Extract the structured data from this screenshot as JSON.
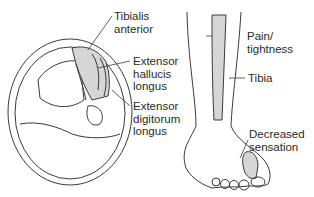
{
  "diagram": {
    "cross_section": {
      "labels": {
        "tibialis": [
          "Tibialis",
          "anterior"
        ],
        "ehl": [
          "Extensor",
          "hallucis",
          "longus"
        ],
        "edl": [
          "Extensor",
          "digitorum",
          "longus"
        ]
      }
    },
    "leg_view": {
      "labels": {
        "pain": [
          "Pain/",
          "tightness"
        ],
        "tibia": [
          "Tibia"
        ],
        "sensation": [
          "Decreased",
          "sensation"
        ]
      }
    },
    "colors": {
      "line": "#3a3a3a",
      "shade": "#d6d6d6",
      "background": "#ffffff"
    }
  }
}
